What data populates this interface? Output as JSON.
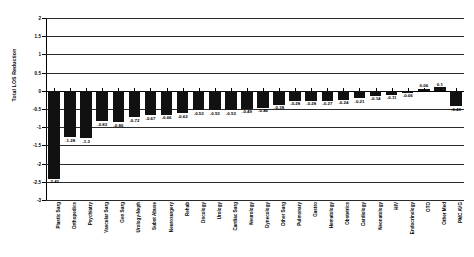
{
  "chart_data": {
    "type": "bar",
    "title": "",
    "xlabel": "",
    "ylabel": "Total LOS Reduction",
    "ylim": [
      -3,
      2
    ],
    "yticks": [
      2,
      1.5,
      1,
      0.5,
      0,
      -0.5,
      -1,
      -1.5,
      -2,
      -2.5,
      -3
    ],
    "ytick_labels": [
      "2",
      "1.5",
      "1",
      "0.5",
      "0",
      "-0.5",
      "-1",
      "-1.5",
      "-2",
      "-2.5",
      "-3"
    ],
    "grid": true,
    "legend": "none",
    "categories": [
      "Plastic Surg",
      "Orthopedics",
      "Psychiatry",
      "Vascular Surg",
      "Gen Surg",
      "Urology-Neph",
      "Subst Abuse",
      "Neurosurgery",
      "Rehab",
      "Oncology",
      "Urology",
      "Cardiac Surg",
      "Neurology",
      "Gynecology",
      "Other Surg",
      "Pulmonary",
      "Gastro",
      "Hematology",
      "Obstetrics",
      "Cardiology",
      "Neonatology",
      "HIV",
      "Endocrinology",
      "OTO",
      "Other Med",
      "PMC AVG"
    ],
    "values": [
      -2.42,
      -1.28,
      -1.3,
      -0.83,
      -0.86,
      -0.72,
      -0.67,
      -0.66,
      -0.62,
      -0.53,
      -0.53,
      -0.53,
      -0.49,
      -0.46,
      -0.38,
      -0.28,
      -0.28,
      -0.27,
      -0.24,
      -0.21,
      -0.14,
      -0.11,
      -0.06,
      0.06,
      0.1,
      0.23
    ],
    "value_labels": [
      "-2.42",
      "-1.28",
      "-1.3",
      "-0.83",
      "-0.86",
      "-0.72",
      "-0.67",
      "-0.66",
      "-0.62",
      "-0.53",
      "-0.53",
      "-0.53",
      "-0.49",
      "-0.46",
      "-0.38",
      "-0.28",
      "-0.28",
      "-0.27",
      "-0.24",
      "-0.21",
      "-0.14",
      "-0.11",
      "-0.06",
      "0.06",
      "0.1",
      "0.23"
    ],
    "last_bar": {
      "category": "PMC AVG",
      "value": -0.43,
      "value_label": "-0.43"
    },
    "colors": {
      "bar": "#111111",
      "axis": "#000000",
      "grid": "#2b2b2b",
      "background": "#ffffff"
    }
  }
}
